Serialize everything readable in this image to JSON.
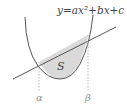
{
  "diagram": {
    "equation": "y=ax²+bx+c",
    "region_label": "S",
    "left_intersection_label": "α",
    "right_intersection_label": "β",
    "colors": {
      "curve": "#555555",
      "line": "#555555",
      "fill": "#d9d9d9",
      "guide": "#aaaaaa",
      "label": "#444444",
      "axis_label": "#999999"
    }
  }
}
